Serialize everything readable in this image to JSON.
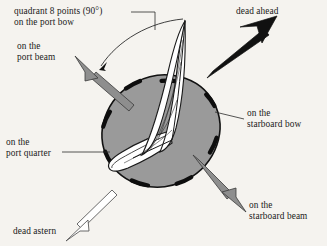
{
  "figure": {
    "background_color": "#f5f3ef",
    "ink_color": "#1a1a1a"
  },
  "labels": {
    "quadrant": {
      "line1": "quadrant 8 points (90°)",
      "line2": "on the port bow"
    },
    "port_beam": {
      "line1": "on the",
      "line2": "port beam"
    },
    "dead_ahead": {
      "line1": "dead ahead"
    },
    "starboard_bow": {
      "line1": "on the",
      "line2": "starboard bow"
    },
    "starboard_beam": {
      "line1": "on the",
      "line2": "starboard beam"
    },
    "port_quarter": {
      "line1": "on the",
      "line2": "port quarter"
    },
    "dead_astern": {
      "line1": "dead astern"
    }
  },
  "arrows": [
    {
      "name": "dead-ahead-arrow",
      "direction": "up-right",
      "style": "solid-black",
      "fill": "#111111",
      "stroke": "#111111"
    },
    {
      "name": "port-beam-arrow",
      "direction": "up-left",
      "style": "solid-gray",
      "fill": "#8e8e8e",
      "stroke": "#3a3a3a"
    },
    {
      "name": "starboard-beam-arrow",
      "direction": "down-right",
      "style": "solid-gray",
      "fill": "#8e8e8e",
      "stroke": "#3a3a3a"
    },
    {
      "name": "dead-astern-arrow",
      "direction": "down-left",
      "style": "hollow-white",
      "fill": "#ffffff",
      "stroke": "#5a5a5a"
    }
  ],
  "compass": {
    "disc_fill": "#9a9a9a",
    "disc_stroke": "#111111",
    "tick_count": 8,
    "tick_color": "#0d0d0d"
  },
  "vessel": {
    "name": "sailboat",
    "hull_fill": "#ffffff",
    "sail_fill": "#ffffff",
    "outline": "#1a1a1a"
  },
  "arc": {
    "name": "quadrant-arc-90",
    "sweep_degrees": 90,
    "color": "#2b2b2b"
  },
  "leaders": {
    "color": "#2b2b2b"
  }
}
